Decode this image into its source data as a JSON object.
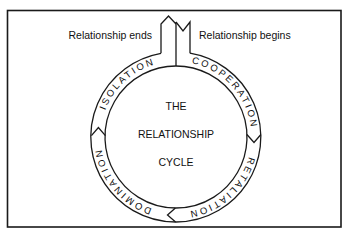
{
  "diagram": {
    "title_lines": [
      "THE",
      "RELATIONSHIP",
      "CYCLE"
    ],
    "top_labels": {
      "end": "Relationship ends",
      "begin": "Relationship begins"
    },
    "ring_segments": [
      {
        "label": "COOPERATION",
        "order": 1
      },
      {
        "label": "RETALIATION",
        "order": 2
      },
      {
        "label": "DOMINATION",
        "order": 3
      },
      {
        "label": "ISOLATION",
        "order": 4
      }
    ],
    "flow_direction": "clockwise",
    "colors": {
      "line": "#1a1a1a",
      "background": "#ffffff"
    }
  }
}
